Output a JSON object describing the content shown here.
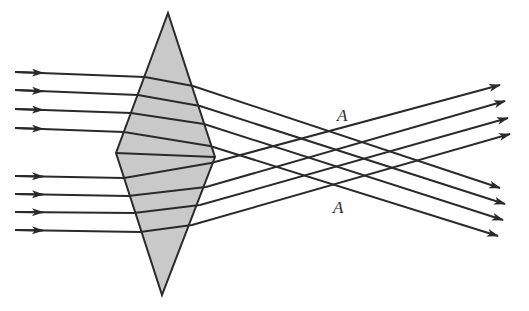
{
  "diagram": {
    "colors": {
      "prism_fill": "#c9c9c9",
      "line": "#2a2a2a",
      "background": "#ffffff"
    },
    "prism": {
      "top": [
        168,
        13
      ],
      "left": [
        116,
        153
      ],
      "right": [
        215,
        157
      ],
      "bottom": [
        162,
        295
      ]
    },
    "labels": [
      {
        "text": "A",
        "x": 337,
        "y": 121
      },
      {
        "text": "A",
        "x": 333,
        "y": 213
      }
    ],
    "upper_rays": [
      {
        "in_y": 72,
        "prism_in": [
          145,
          77
        ],
        "prism_out": [
          193,
          86
        ],
        "end": [
          500,
          188
        ]
      },
      {
        "in_y": 90,
        "prism_in": [
          138,
          95
        ],
        "prism_out": [
          200,
          106
        ],
        "end": [
          505,
          204
        ]
      },
      {
        "in_y": 109,
        "prism_in": [
          131,
          113
        ],
        "prism_out": [
          204,
          124
        ],
        "end": [
          503,
          220
        ]
      },
      {
        "in_y": 128,
        "prism_in": [
          124,
          132
        ],
        "prism_out": [
          210,
          146
        ],
        "end": [
          498,
          236
        ]
      }
    ],
    "lower_rays": [
      {
        "in_y": 176,
        "prism_in": [
          124,
          178
        ],
        "prism_out": [
          211,
          163
        ],
        "end": [
          500,
          85
        ]
      },
      {
        "in_y": 194,
        "prism_in": [
          128,
          196
        ],
        "prism_out": [
          206,
          187
        ],
        "end": [
          505,
          101
        ]
      },
      {
        "in_y": 212,
        "prism_in": [
          134,
          213
        ],
        "prism_out": [
          200,
          205
        ],
        "end": [
          508,
          118
        ]
      },
      {
        "in_y": 230,
        "prism_in": [
          140,
          232
        ],
        "prism_out": [
          192,
          225
        ],
        "end": [
          510,
          134
        ]
      }
    ],
    "ray_start_x": 15
  }
}
